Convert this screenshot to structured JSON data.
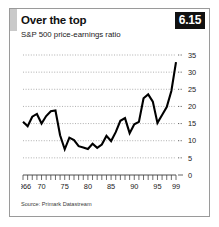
{
  "figure": {
    "title": "Over the top",
    "subtitle": "S&P 500 price-earnings ratio",
    "badge": "6.15",
    "source": "Source: Primark Datastream",
    "accent_color": "#c9c9c9",
    "badge_bg": "#111111",
    "badge_fg": "#ffffff",
    "line_color": "#000000",
    "grid_color": "#8d8d8d"
  },
  "chart_data": {
    "type": "line",
    "title": "Over the top",
    "subtitle": "S&P 500 price-earnings ratio",
    "xlabel": "",
    "ylabel": "",
    "ylim": [
      0,
      35
    ],
    "xlim": [
      1966,
      1999
    ],
    "grid": true,
    "legend": false,
    "ytick_labels": [
      "35",
      "30",
      "25",
      "20",
      "15",
      "10",
      "5",
      "0"
    ],
    "ytick_values": [
      35,
      30,
      25,
      20,
      15,
      10,
      5,
      0
    ],
    "xtick_labels": [
      "1966",
      "70",
      "75",
      "80",
      "85",
      "90",
      "95",
      "99"
    ],
    "xtick_values": [
      1966,
      1970,
      1975,
      1980,
      1985,
      1990,
      1995,
      1999
    ],
    "minor_xticks_per_year": true,
    "series": [
      {
        "name": "S&P 500 price-earnings ratio",
        "color": "#000000",
        "x": [
          1966,
          1967,
          1968,
          1969,
          1970,
          1971,
          1972,
          1973,
          1974,
          1975,
          1976,
          1977,
          1978,
          1979,
          1980,
          1981,
          1982,
          1983,
          1984,
          1985,
          1986,
          1987,
          1988,
          1989,
          1990,
          1991,
          1992,
          1993,
          1994,
          1995,
          1996,
          1997,
          1998,
          1999
        ],
        "values": [
          15.5,
          14.2,
          17.0,
          17.8,
          15.0,
          17.2,
          18.6,
          18.8,
          11.6,
          7.5,
          10.9,
          10.2,
          8.4,
          8.0,
          7.6,
          9.1,
          7.9,
          8.9,
          11.4,
          9.9,
          12.5,
          15.8,
          16.6,
          12.2,
          14.8,
          15.5,
          22.4,
          23.5,
          21.4,
          15.2,
          17.5,
          19.8,
          24.5,
          32.9
        ]
      }
    ]
  }
}
